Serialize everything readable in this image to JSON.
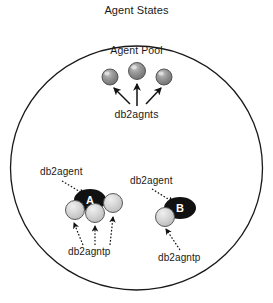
{
  "diagram": {
    "title": "Agent States",
    "pool_label": "Agent Pool",
    "boundary_shape": "ellipse",
    "colors": {
      "outline": "#1a1a1a",
      "idle_agent_fill": "#8a8a8a",
      "pooled_agent_fill": "#d0d0d0",
      "coordinator_fill": "#111111",
      "coordinator_text": "#ffffff",
      "background": "#ffffff",
      "label_text": "#1a1a1a"
    },
    "pool": {
      "label": "Agent Pool",
      "arrow_label": "db2agnts",
      "agent_count": 3,
      "agents": [
        {
          "name": "pool-agent-1",
          "cx": 110,
          "cy": 77,
          "r": 8
        },
        {
          "name": "pool-agent-2",
          "cx": 137,
          "cy": 71,
          "r": 8.5
        },
        {
          "name": "pool-agent-3",
          "cx": 164,
          "cy": 77,
          "r": 8
        }
      ]
    },
    "groups": [
      {
        "id": "group-a",
        "coordinator_letter": "A",
        "coordinator_label": "db2agent",
        "subagent_label": "db2agntp",
        "subagent_count": 3,
        "coordinator": {
          "cx": 90,
          "cy": 200,
          "rx": 16,
          "ry": 11
        },
        "subagents": [
          {
            "name": "subagent-a-1",
            "cx": 75,
            "cy": 210,
            "r": 9.5
          },
          {
            "name": "subagent-a-2",
            "cx": 95,
            "cy": 213,
            "r": 9.5
          },
          {
            "name": "subagent-a-3",
            "cx": 113,
            "cy": 203,
            "r": 9.5
          }
        ]
      },
      {
        "id": "group-b",
        "coordinator_letter": "B",
        "coordinator_label": "db2agent",
        "subagent_label": "db2agntp",
        "subagent_count": 1,
        "coordinator": {
          "cx": 180,
          "cy": 208,
          "rx": 16,
          "ry": 11
        },
        "subagents": [
          {
            "name": "subagent-b-1",
            "cx": 165,
            "cy": 217,
            "r": 9.5
          }
        ]
      }
    ],
    "labels": {
      "db2agnts": "db2agnts",
      "db2agent_left": "db2agent",
      "db2agent_right": "db2agent",
      "db2agntp_left": "db2agntp",
      "db2agntp_right": "db2agntp"
    }
  }
}
